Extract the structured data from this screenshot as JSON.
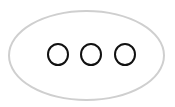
{
  "button": {
    "label": "More options",
    "icon": "ellipsis-icon",
    "dots": 3,
    "border_color": "#cfcfcf",
    "dot_color": "#111111"
  }
}
